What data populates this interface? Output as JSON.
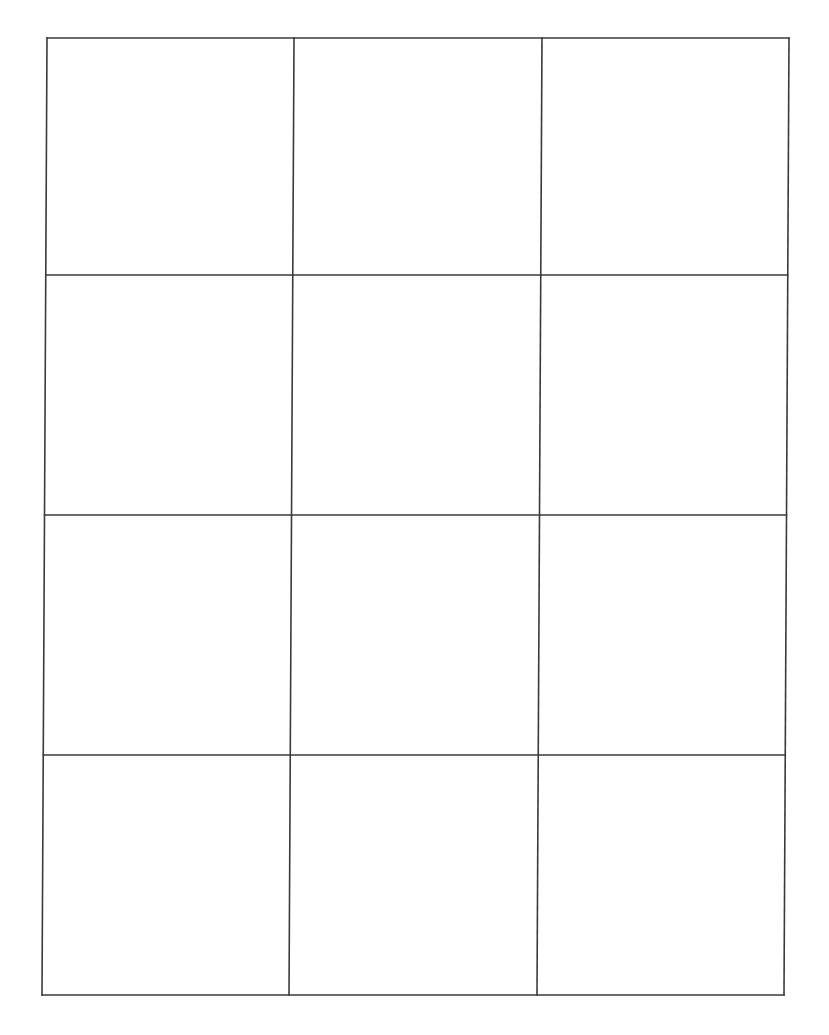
{
  "document": {
    "type": "blank-grid-template",
    "rows": 4,
    "columns": 3,
    "background_color": "#ffffff",
    "line_color": "#3a3a3a",
    "line_width": 1.6
  },
  "grid": {
    "corners": {
      "top_left": [
        47,
        38
      ],
      "top_right": [
        789,
        38
      ],
      "bottom_left": [
        42,
        995
      ],
      "bottom_right": [
        784,
        995
      ]
    },
    "row_fractions": [
      0,
      0.2477,
      0.4984,
      0.7492,
      1
    ],
    "col_fractions": [
      0,
      0.3329,
      0.6671,
      1
    ]
  },
  "cells": [
    {
      "row": 1,
      "col": 1,
      "text": ""
    },
    {
      "row": 1,
      "col": 2,
      "text": ""
    },
    {
      "row": 1,
      "col": 3,
      "text": ""
    },
    {
      "row": 2,
      "col": 1,
      "text": ""
    },
    {
      "row": 2,
      "col": 2,
      "text": ""
    },
    {
      "row": 2,
      "col": 3,
      "text": ""
    },
    {
      "row": 3,
      "col": 1,
      "text": ""
    },
    {
      "row": 3,
      "col": 2,
      "text": ""
    },
    {
      "row": 3,
      "col": 3,
      "text": ""
    },
    {
      "row": 4,
      "col": 1,
      "text": ""
    },
    {
      "row": 4,
      "col": 2,
      "text": ""
    },
    {
      "row": 4,
      "col": 3,
      "text": ""
    }
  ]
}
